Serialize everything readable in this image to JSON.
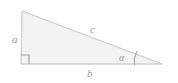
{
  "figure": {
    "type": "right-triangle-diagram",
    "background_color": "#ffffff",
    "fill_color": "#f3f3f3",
    "stroke_color": "#d4d4d4",
    "label_color": "#9a9a9a",
    "vertices": {
      "top_left": [
        22,
        11
      ],
      "bottom_left": [
        21,
        64
      ],
      "right": [
        162,
        64
      ]
    },
    "labels": {
      "leg_vertical": "a",
      "leg_horizontal": "b",
      "hypotenuse": "c",
      "angle": "α"
    },
    "markers": {
      "right_angle_marker": "right-angle-square",
      "angle_marker": "angle-arc"
    }
  }
}
